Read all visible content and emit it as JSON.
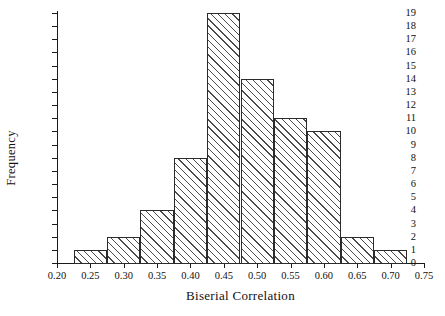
{
  "chart_data": {
    "type": "bar",
    "title": "",
    "xlabel": "Biserial Correlation",
    "ylabel": "Frequency",
    "categories": [
      "0.25",
      "0.30",
      "0.35",
      "0.40",
      "0.45",
      "0.50",
      "0.55",
      "0.60",
      "0.65",
      "0.70"
    ],
    "values": [
      1,
      2,
      4,
      8,
      19,
      14,
      11,
      10,
      2,
      1
    ],
    "bin_width": 0.05,
    "xlim": [
      0.2,
      0.75
    ],
    "ylim": [
      0,
      19
    ],
    "xticks": [
      "0.20",
      "0.25",
      "0.30",
      "0.35",
      "0.40",
      "0.45",
      "0.50",
      "0.55",
      "0.60",
      "0.65",
      "0.70",
      "0.75"
    ],
    "yticks": [
      "0",
      "1",
      "2",
      "3",
      "4",
      "5",
      "6",
      "7",
      "8",
      "9",
      "10",
      "11",
      "12",
      "13",
      "14",
      "15",
      "16",
      "17",
      "18",
      "19"
    ],
    "grid": false,
    "legend": null,
    "bar_style": "diagonal-hatch",
    "colors": {
      "axis": "#1a1a1a",
      "bar_edge": "#2b2b2b",
      "bar_hatch": "#4a4a4a",
      "background": "#ffffff",
      "text": "#111111"
    }
  }
}
